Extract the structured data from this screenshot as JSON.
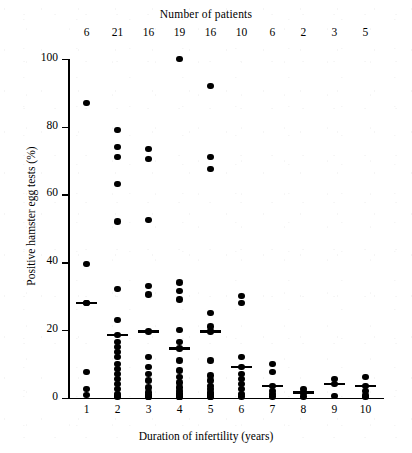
{
  "chart_data": {
    "type": "scatter",
    "title": "Number of patients",
    "xlabel": "Duration of infertility (years)",
    "ylabel": "Positive hamster egg tests (%)",
    "xlim": [
      0.4,
      10.6
    ],
    "ylim": [
      0,
      100
    ],
    "grid": false,
    "legend": null,
    "xticks": [
      1,
      2,
      3,
      4,
      5,
      6,
      7,
      8,
      9,
      10
    ],
    "xtick_labels": [
      "1",
      "2",
      "3",
      "4",
      "5",
      "6",
      "7",
      "8",
      "9",
      "10"
    ],
    "yticks": [
      0,
      20,
      40,
      60,
      80,
      100
    ],
    "ytick_labels": [
      "0",
      "20",
      "40",
      "60",
      "80",
      "100"
    ],
    "top_axis_label": "Number of patients",
    "patient_counts": [
      6,
      21,
      16,
      19,
      16,
      10,
      6,
      2,
      3,
      5
    ],
    "marker": "filled-circle",
    "marker_color": "#000000",
    "median_marker": "horizontal-bar",
    "groups": [
      {
        "x": 1,
        "n": 6,
        "median": 28,
        "values": [
          87,
          39.5,
          28,
          28,
          7.5,
          2.5,
          0.8
        ]
      },
      {
        "x": 2,
        "n": 21,
        "median": 18.5,
        "values": [
          79,
          74,
          71,
          63,
          52,
          32,
          23,
          18.5,
          16.5,
          15,
          13.5,
          12,
          10,
          8.5,
          7,
          5.5,
          4,
          2.5,
          1,
          0.5,
          0.2
        ]
      },
      {
        "x": 3,
        "n": 16,
        "median": 19.5,
        "values": [
          73.5,
          70.5,
          52.5,
          33,
          30.5,
          19.5,
          12,
          9,
          7,
          5,
          3,
          1.5,
          0.8,
          0.4,
          0.2,
          0.1
        ]
      },
      {
        "x": 4,
        "n": 19,
        "median": 14.5,
        "values": [
          100,
          34,
          31.5,
          29,
          20,
          16.5,
          14.5,
          11,
          8,
          6,
          4.5,
          3,
          2,
          1.2,
          0.8,
          0.5,
          0.3,
          0.2,
          0.1
        ]
      },
      {
        "x": 5,
        "n": 16,
        "median": 19.5,
        "values": [
          92,
          71,
          67.5,
          25,
          21,
          19.5,
          11,
          6.5,
          5,
          3.5,
          2.5,
          1.5,
          1,
          0.6,
          0.3,
          0.1
        ]
      },
      {
        "x": 6,
        "n": 10,
        "median": 9,
        "values": [
          30,
          28,
          12,
          9,
          7,
          5.5,
          4,
          2.5,
          1,
          0.3
        ]
      },
      {
        "x": 7,
        "n": 6,
        "median": 3.5,
        "values": [
          10,
          7.5,
          3.5,
          2,
          1,
          0.3
        ]
      },
      {
        "x": 8,
        "n": 2,
        "median": 1.5,
        "values": [
          2.5,
          1.5,
          0.3
        ]
      },
      {
        "x": 9,
        "n": 3,
        "median": 4,
        "values": [
          5.5,
          4,
          0.5
        ]
      },
      {
        "x": 10,
        "n": 5,
        "median": 3.5,
        "values": [
          6,
          3.5,
          2,
          0.6,
          0.2
        ]
      }
    ]
  }
}
